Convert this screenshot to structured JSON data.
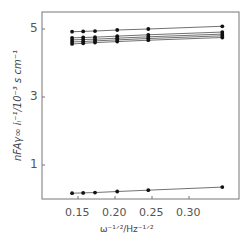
{
  "chart_data": {
    "type": "line",
    "title": "",
    "xlabel": "ω^-1/2 / Hz^-1/2",
    "ylabel": "nFAγ∞ i_L^-1 / 10^-3 s cm^-1",
    "x_ticks": [
      "0.15",
      "0.20",
      "0.25",
      "0.30"
    ],
    "y_ticks": [
      "1",
      "3",
      "5"
    ],
    "xlim": [
      0.12,
      0.36
    ],
    "ylim": [
      0,
      5.5
    ],
    "grid": false,
    "legend": null,
    "x": [
      0.142,
      0.157,
      0.173,
      0.203,
      0.245,
      0.345
    ],
    "series": [
      {
        "name": "series-1",
        "values": [
          4.92,
          4.93,
          4.94,
          4.97,
          5.0,
          5.08
        ]
      },
      {
        "name": "series-2",
        "values": [
          4.74,
          4.75,
          4.76,
          4.79,
          4.83,
          4.91
        ]
      },
      {
        "name": "series-3",
        "values": [
          4.68,
          4.69,
          4.7,
          4.73,
          4.77,
          4.85
        ]
      },
      {
        "name": "series-4",
        "values": [
          4.62,
          4.63,
          4.65,
          4.68,
          4.72,
          4.8
        ]
      },
      {
        "name": "series-5",
        "values": [
          4.56,
          4.58,
          4.6,
          4.63,
          4.67,
          4.75
        ]
      },
      {
        "name": "series-6",
        "values": [
          0.17,
          0.18,
          0.19,
          0.22,
          0.26,
          0.35
        ]
      }
    ]
  },
  "labels": {
    "xlabel": "ω⁻¹ᐟ²/Hz⁻¹ᐟ²",
    "ylabel": "nFAγ∞ iₗ⁻¹/10⁻³ s cm⁻¹"
  }
}
